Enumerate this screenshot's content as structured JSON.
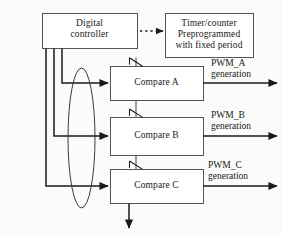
{
  "diagram": {
    "stroke_color": "#1a1a1a",
    "background_color": "#fbfbfa",
    "blocks": [
      {
        "id": "digital-controller",
        "label": "Digital\ncontroller",
        "x": 42,
        "y": 13,
        "w": 95,
        "h": 35
      },
      {
        "id": "timer-counter",
        "label": "Timer/counter\nPreprogrammed\nwith fixed period",
        "x": 165,
        "y": 13,
        "w": 88,
        "h": 44
      },
      {
        "id": "compare-a",
        "label": "Compare A",
        "x": 110,
        "y": 66,
        "w": 93,
        "h": 34
      },
      {
        "id": "compare-b",
        "label": "Compare B",
        "x": 110,
        "y": 117,
        "w": 93,
        "h": 38
      },
      {
        "id": "compare-c",
        "label": "Compare C",
        "x": 110,
        "y": 169,
        "w": 93,
        "h": 34
      }
    ],
    "outputs": [
      {
        "id": "pwm-a",
        "label": "PWM_A\ngeneration",
        "x": 211,
        "y": 58,
        "line_y": 83
      },
      {
        "id": "pwm-b",
        "label": "PWM_B\ngeneration",
        "x": 211,
        "y": 110,
        "line_y": 136
      },
      {
        "id": "pwm-c",
        "label": "PWM_C\ngeneration",
        "x": 208,
        "y": 160,
        "line_y": 186
      }
    ],
    "bus": {
      "id": "signal-bus-ellipse",
      "cx": 81.5,
      "cy": 138,
      "rx": 13.5,
      "ry": 70
    },
    "connectors": [
      {
        "id": "controller-to-timer",
        "style": "dotted",
        "from": "digital-controller",
        "to": "timer-counter"
      },
      {
        "id": "timer-to-compare-a",
        "style": "barbed",
        "from": "timer-counter",
        "to": "compare-a"
      },
      {
        "id": "compare-a-to-compare-b",
        "style": "barbed",
        "from": "compare-a",
        "to": "compare-b"
      },
      {
        "id": "compare-b-to-compare-c",
        "style": "barbed",
        "from": "compare-b",
        "to": "compare-c"
      },
      {
        "id": "controller-to-compare-a",
        "style": "solid",
        "from": "digital-controller",
        "to": "compare-a"
      },
      {
        "id": "controller-to-compare-b",
        "style": "solid",
        "from": "digital-controller",
        "to": "compare-b"
      },
      {
        "id": "controller-to-compare-c",
        "style": "solid",
        "from": "digital-controller",
        "to": "compare-c"
      },
      {
        "id": "compare-c-down-output",
        "style": "solid",
        "from": "compare-c",
        "to": ""
      }
    ]
  }
}
